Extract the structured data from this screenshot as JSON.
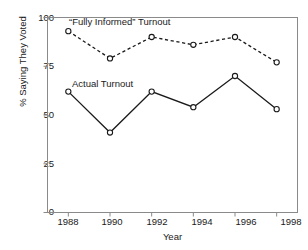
{
  "chart_data": {
    "type": "line",
    "title": "",
    "xlabel": "Year",
    "ylabel": "% Saying They Voted",
    "categories": [
      "1988",
      "1990",
      "1992",
      "1994",
      "1996",
      "1998"
    ],
    "x": [
      1988,
      1990,
      1992,
      1994,
      1996,
      1998
    ],
    "xlim": [
      1987,
      1999
    ],
    "ylim": [
      0,
      100
    ],
    "yticks": [
      "0",
      "25",
      "50",
      "75",
      "100"
    ],
    "ytick_values": [
      0,
      25,
      50,
      75,
      100
    ],
    "grid": false,
    "legend": "inline-annotations",
    "series": [
      {
        "name": "“Fully Informed” Turnout",
        "values": [
          93,
          79,
          90,
          86,
          90,
          77
        ],
        "style": "dashed",
        "marker": "open-circle",
        "color": "#1a1a1a"
      },
      {
        "name": "Actual Turnout",
        "values": [
          62,
          41,
          62,
          54,
          70,
          53
        ],
        "style": "solid",
        "marker": "open-circle",
        "color": "#1a1a1a"
      }
    ],
    "annotations": [
      {
        "text": "“Fully Informed” Turnout",
        "series": 0
      },
      {
        "text": "Actual Turnout",
        "series": 1
      }
    ]
  },
  "axes": {
    "frame_color": "#8a8a8a",
    "text_color": "#1a1a1a"
  }
}
